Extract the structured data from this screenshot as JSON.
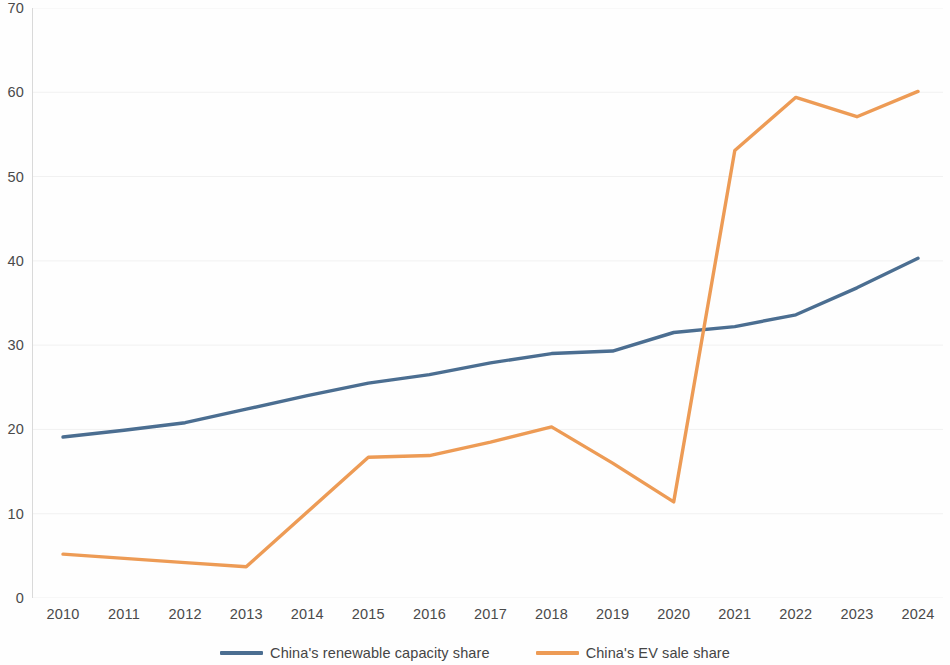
{
  "chart_data": {
    "type": "line",
    "title": "",
    "subtitle": "",
    "xlabel": "",
    "ylabel": "",
    "categories": [
      "2010",
      "2011",
      "2012",
      "2013",
      "2014",
      "2015",
      "2016",
      "2017",
      "2018",
      "2019",
      "2020",
      "2021",
      "2022",
      "2023",
      "2024"
    ],
    "x": [
      2010,
      2011,
      2012,
      2013,
      2014,
      2015,
      2016,
      2017,
      2018,
      2019,
      2020,
      2021,
      2022,
      2023,
      2024
    ],
    "xlim": [
      2010,
      2024
    ],
    "ylim": [
      0,
      70
    ],
    "y_ticks": [
      0,
      10,
      20,
      30,
      40,
      50,
      60,
      70
    ],
    "y_tick_labels": [
      "0",
      "10",
      "20",
      "30",
      "40",
      "50",
      "60",
      "70"
    ],
    "grid": "faint-horizontal",
    "legend_position": "bottom-center",
    "series": [
      {
        "name": "China's renewable capacity share",
        "color": "#4b6e91",
        "values": [
          19.1,
          19.9,
          20.8,
          22.4,
          24.0,
          25.5,
          26.5,
          27.9,
          29.0,
          29.3,
          31.5,
          32.2,
          33.6,
          36.8,
          40.3
        ]
      },
      {
        "name": "China's EV sale share",
        "color": "#ed9b55",
        "values": [
          5.2,
          4.7,
          4.2,
          3.7,
          10.2,
          16.7,
          16.9,
          18.5,
          20.3,
          16.0,
          11.4,
          53.1,
          59.4,
          57.1,
          60.1
        ]
      }
    ]
  },
  "legend": {
    "items": [
      {
        "label": "China's renewable capacity share",
        "color": "#4b6e91"
      },
      {
        "label": "China's EV sale share",
        "color": "#ed9b55"
      }
    ]
  },
  "axes": {
    "y_labels": [
      "70",
      "60",
      "50",
      "40",
      "30",
      "20",
      "10",
      "0"
    ],
    "x_labels": [
      "2010",
      "2011",
      "2012",
      "2013",
      "2014",
      "2015",
      "2016",
      "2017",
      "2018",
      "2019",
      "2020",
      "2021",
      "2022",
      "2023",
      "2024"
    ]
  }
}
